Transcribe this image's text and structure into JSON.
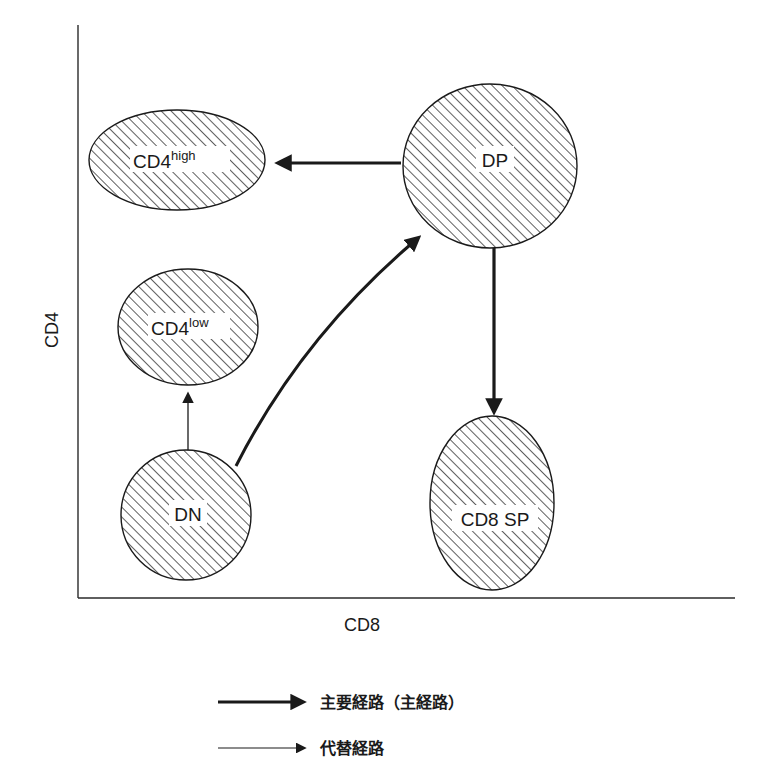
{
  "diagram": {
    "axes": {
      "y_label": "CD4",
      "x_label": "CD8"
    },
    "nodes": {
      "cd4high": {
        "base": "CD4",
        "sup": "high"
      },
      "dp": {
        "label": "DP"
      },
      "cd4low": {
        "base": "CD4",
        "sup": "low"
      },
      "dn": {
        "label": "DN"
      },
      "cd8sp": {
        "label": "CD8 SP"
      }
    },
    "edges": [
      {
        "from": "DP",
        "to": "CD4high",
        "type": "major"
      },
      {
        "from": "DP",
        "to": "CD8 SP",
        "type": "major"
      },
      {
        "from": "DN",
        "to": "DP",
        "type": "major"
      },
      {
        "from": "DN",
        "to": "CD4low",
        "type": "alternative"
      }
    ],
    "legend": {
      "major": "主要経路（主経路）",
      "alternative": "代替経路"
    },
    "colors": {
      "ink": "#1a1a1a",
      "background": "#ffffff"
    }
  }
}
